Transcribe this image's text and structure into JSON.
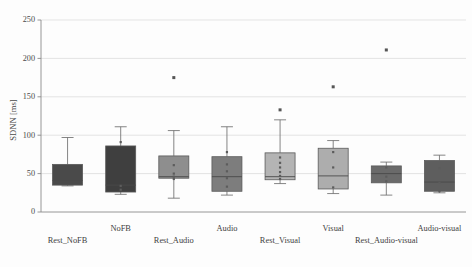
{
  "chart_data": {
    "type": "boxplot",
    "title": "",
    "xlabel": "",
    "ylabel": "SDNN [ms]",
    "ylim": [
      0,
      250
    ],
    "yticks": [
      0,
      50,
      100,
      150,
      200,
      250
    ],
    "ytick_labels": [
      "0",
      "50",
      "100",
      "150",
      "200",
      "250"
    ],
    "grid": true,
    "legend": "none",
    "categories": [
      "Rest_NoFB",
      "NoFB",
      "Rest_Audio",
      "Audio",
      "Rest_Visual",
      "Visual",
      "Rest_Audio-visual",
      "Audio-visual"
    ],
    "boxes": [
      {
        "label": "Rest_NoFB",
        "whisker_low": 34,
        "q1": 35,
        "median": 41,
        "q3": 62,
        "whisker_high": 97,
        "fill": "#4a4a4a",
        "outliers": [],
        "points": []
      },
      {
        "label": "NoFB",
        "whisker_low": 23,
        "q1": 26,
        "median": 35,
        "q3": 86,
        "whisker_high": 111,
        "fill": "#3f3f3f",
        "outliers": [],
        "points": [
          91,
          34,
          29
        ]
      },
      {
        "label": "Rest_Audio",
        "whisker_low": 18,
        "q1": 44,
        "median": 46,
        "q3": 73,
        "whisker_high": 106,
        "fill": "#8e8e8e",
        "outliers": [
          175
        ],
        "points": [
          61,
          50,
          46,
          43
        ]
      },
      {
        "label": "Audio",
        "whisker_low": 22,
        "q1": 27,
        "median": 46,
        "q3": 72,
        "whisker_high": 111,
        "fill": "#7d7d7d",
        "outliers": [],
        "points": [
          78,
          62,
          53,
          44,
          33
        ]
      },
      {
        "label": "Rest_Visual",
        "whisker_low": 37,
        "q1": 42,
        "median": 46,
        "q3": 77,
        "whisker_high": 120,
        "fill": "#b4b4b4",
        "outliers": [
          133
        ],
        "points": [
          71,
          64,
          58,
          52,
          47,
          43
        ]
      },
      {
        "label": "Visual",
        "whisker_low": 24,
        "q1": 30,
        "median": 47,
        "q3": 83,
        "whisker_high": 93,
        "fill": "#adadad",
        "outliers": [
          163
        ],
        "points": [
          78,
          58,
          32
        ]
      },
      {
        "label": "Rest_Audio-visual",
        "whisker_low": 22,
        "q1": 38,
        "median": 50,
        "q3": 60,
        "whisker_high": 65,
        "fill": "#6a6a6a",
        "outliers": [
          211
        ],
        "points": [
          58,
          46,
          40
        ]
      },
      {
        "label": "Audio-visual",
        "whisker_low": 25,
        "q1": 27,
        "median": 39,
        "q3": 67,
        "whisker_high": 74,
        "fill": "#5e5e5e",
        "outliers": [],
        "points": [
          57,
          38,
          27
        ]
      }
    ]
  }
}
